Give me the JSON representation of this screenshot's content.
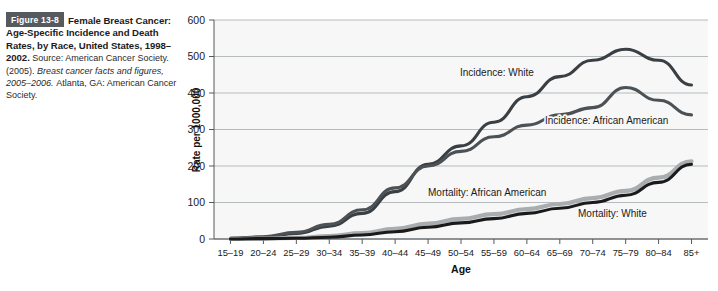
{
  "caption": {
    "badge": "Figure 13-8",
    "title": "Female Breast Cancer: Age-Specific Incidence and Death Rates, by Race, United States, 1998–2002.",
    "source_prefix": "Source: American Cancer Society. (2005).",
    "source_italic": "Breast cancer facts and figures, 2005–2006.",
    "source_suffix": "Atlanta, GA: American Cancer Society."
  },
  "colors": {
    "badge_bg": "#555a5e",
    "incidence_white": "#3a3f44",
    "incidence_african_american": "#4c5155",
    "mortality_white": "#1a1a1a",
    "mortality_african_american": "#a9adb0",
    "gridline": "#9aa0a4",
    "plot_bg": "#f7f7f7"
  },
  "chart_data": {
    "type": "line",
    "title": "",
    "xlabel": "Age",
    "ylabel": "Rate per 1000,000",
    "ylim": [
      0,
      600
    ],
    "yticks": [
      0,
      100,
      200,
      300,
      400,
      500,
      600
    ],
    "grid": true,
    "legend_position": "inline-annotations",
    "categories": [
      "15–19",
      "20–24",
      "25–29",
      "30–34",
      "35–39",
      "40–44",
      "45–49",
      "50–54",
      "55–59",
      "60–64",
      "65–69",
      "70–74",
      "75–79",
      "80–84",
      "85+"
    ],
    "series": [
      {
        "name": "Incidence: White",
        "label": "Incidence: White",
        "color": "#3a3f44",
        "width": 3.1,
        "values": [
          2,
          5,
          15,
          35,
          70,
          130,
          205,
          255,
          320,
          390,
          445,
          490,
          520,
          490,
          422
        ]
      },
      {
        "name": "Incidence: African American",
        "label": "Incidence: African American",
        "color": "#4c5155",
        "width": 3.1,
        "values": [
          2,
          6,
          18,
          40,
          80,
          140,
          200,
          240,
          280,
          312,
          340,
          360,
          415,
          380,
          340
        ]
      },
      {
        "name": "Mortality: African American",
        "label": "Mortality: African American",
        "color": "#a9adb0",
        "width": 4.2,
        "values": [
          0,
          1,
          3,
          8,
          16,
          28,
          42,
          55,
          68,
          82,
          96,
          112,
          132,
          168,
          213
        ]
      },
      {
        "name": "Mortality: White",
        "label": "Mortality: White",
        "color": "#1a1a1a",
        "width": 3.1,
        "values": [
          0,
          1,
          2,
          5,
          11,
          20,
          32,
          44,
          56,
          70,
          84,
          100,
          120,
          155,
          205
        ]
      }
    ],
    "annotations": [
      {
        "text": "Incidence: White",
        "x_px": 460,
        "y_px": 76
      },
      {
        "text": "Incidence: African American",
        "x_px": 545,
        "y_px": 124
      },
      {
        "text": "Mortality: African American",
        "x_px": 428,
        "y_px": 196
      },
      {
        "text": "Mortality: White",
        "x_px": 578,
        "y_px": 217
      }
    ]
  }
}
